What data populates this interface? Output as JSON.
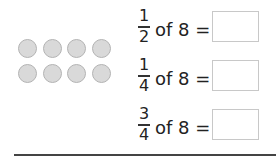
{
  "counters": {
    "count": 8,
    "rows": 2,
    "per_row": 4,
    "fill_color": "#d9d9d9",
    "stroke_color": "#b3b3b3"
  },
  "questions": [
    {
      "numerator": "1",
      "denominator": "2",
      "text": "of 8 =",
      "answer": ""
    },
    {
      "numerator": "1",
      "denominator": "4",
      "text": "of 8 =",
      "answer": ""
    },
    {
      "numerator": "3",
      "denominator": "4",
      "text": "of 8 =",
      "answer": ""
    }
  ]
}
